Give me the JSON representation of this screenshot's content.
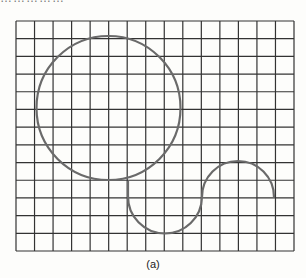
{
  "header_fragment": "……………",
  "figure": {
    "caption": "(a)",
    "grid": {
      "x0": 16,
      "y0": 21,
      "x1": 294,
      "y1": 251,
      "columns": 15,
      "rows": 13,
      "line_color": "#333333"
    },
    "circle": {
      "cx": 108.5,
      "cy": 108,
      "r": 72,
      "stroke": "#6a6a6a"
    },
    "s_curve": {
      "stroke": "#6a6a6a",
      "lower_arc": {
        "start": [
          128,
          181
        ],
        "center": [
          165,
          196
        ],
        "bottom_y": 233,
        "end": [
          202,
          197
        ]
      },
      "upper_arc": {
        "start": [
          202,
          197
        ],
        "center": [
          238,
          197
        ],
        "top_y": 161,
        "end": [
          274,
          197
        ]
      }
    }
  }
}
